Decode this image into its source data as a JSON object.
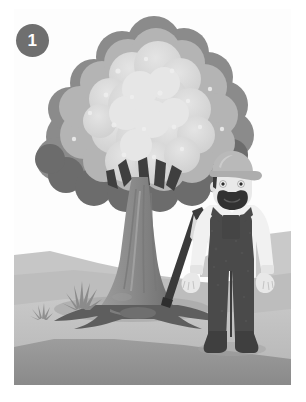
{
  "figure": {
    "step_number": "1",
    "frame": {
      "x": 14,
      "y": 9,
      "width": 277,
      "height": 376
    }
  },
  "badge": {
    "label": "1",
    "shape": "circle",
    "fill": "#6f6f6f",
    "text_color": "#ffffff"
  },
  "palette": {
    "sky": "#fdfdfd",
    "hill_far": "#c9c9c9",
    "hill_mid": "#b3b3b3",
    "ground_light": "#c4c4c4",
    "ground_mid": "#a8a8a8",
    "ground_dark": "#8f8f8f",
    "ground_shadow": "#9b9b9b",
    "foliage_light": "#d6d6d6",
    "foliage_mid": "#b6b6b6",
    "foliage_dark": "#8d8d8d",
    "foliage_darkest": "#6b6b6b",
    "trunk_light": "#a5a5a5",
    "trunk_mid": "#8e8e8e",
    "trunk_dark": "#6d6d6d",
    "root_dark": "#5f5f5f",
    "skin": "#e8e8e8",
    "shirt": "#f2f2f2",
    "overalls": "#4a4a4a",
    "hat": "#b9b9b9",
    "hair_beard": "#333333",
    "axe_handle": "#3a3a3a",
    "axe_head": "#dadada",
    "boot": "#3f3f3f",
    "grass": "#8a8a8a"
  },
  "scene_elements": {
    "tree": {
      "name": "large leafy tree",
      "foliage_label": "tree canopy",
      "trunk_label": "tree trunk",
      "roots_label": "exposed roots"
    },
    "character": {
      "name": "lumberjack",
      "hat_label": "work cap",
      "beard_label": "beard and mustache",
      "overalls_label": "bib overalls",
      "shirt_label": "long sleeve shirt",
      "boots_label": "work boots"
    },
    "axe": {
      "name": "axe",
      "handle_label": "axe handle",
      "head_label": "axe head"
    },
    "ground": {
      "near_label": "foreground grass field",
      "hill_label": "background hills"
    },
    "grass_tufts": [
      {
        "label": "small grass tuft"
      },
      {
        "label": "large grass tuft"
      }
    ]
  }
}
